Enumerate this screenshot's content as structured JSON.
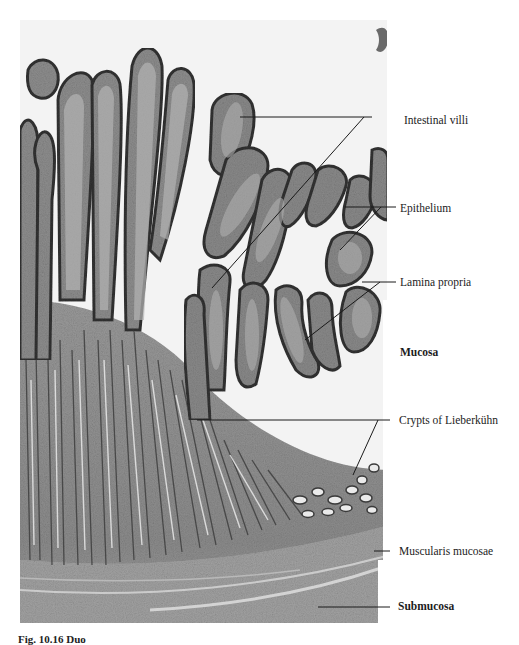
{
  "figure": {
    "caption_partial": "Fig. 10.16 Duo",
    "colors": {
      "background": "#ffffff",
      "tissue_dark": "#4a4a4a",
      "tissue_mid": "#8a8a8a",
      "tissue_light": "#c4c4c4",
      "lumen": "#f4f4f4",
      "leader_line": "#1a1a1a"
    }
  },
  "labels": [
    {
      "id": "intestinal-villi",
      "text": "Intestinal villi",
      "bold": false
    },
    {
      "id": "epithelium",
      "text": "Epithelium",
      "bold": false
    },
    {
      "id": "lamina-propria",
      "text": "Lamina propria",
      "bold": false
    },
    {
      "id": "mucosa",
      "text": "Mucosa",
      "bold": true
    },
    {
      "id": "crypts-of-lieberkuhn",
      "text": "Crypts of Lieberkühn",
      "bold": false
    },
    {
      "id": "muscularis-mucosae",
      "text": "Muscularis mucosae",
      "bold": false
    },
    {
      "id": "submucosa",
      "text": "Submucosa",
      "bold": true
    }
  ]
}
